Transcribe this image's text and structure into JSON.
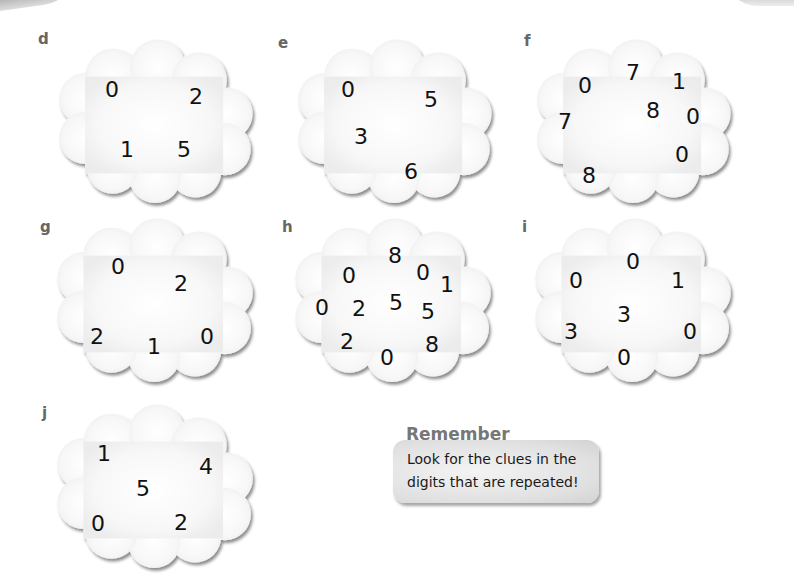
{
  "colors": {
    "cloud_fill": "#fafafa",
    "cloud_shadow": "#9a9a9a",
    "label": "#666666",
    "digit": "#111111",
    "remember_title": "#777777"
  },
  "puzzles": [
    {
      "label": "d",
      "digits": [
        "0",
        "2",
        "1",
        "5"
      ]
    },
    {
      "label": "e",
      "digits": [
        "0",
        "5",
        "3",
        "6"
      ]
    },
    {
      "label": "f",
      "digits": [
        "7",
        "0",
        "1",
        "8",
        "0",
        "7",
        "0",
        "8"
      ]
    },
    {
      "label": "g",
      "digits": [
        "0",
        "2",
        "2",
        "1",
        "0"
      ]
    },
    {
      "label": "h",
      "digits": [
        "8",
        "0",
        "0",
        "1",
        "0",
        "2",
        "5",
        "5",
        "2",
        "0",
        "8"
      ]
    },
    {
      "label": "i",
      "digits": [
        "0",
        "0",
        "1",
        "3",
        "3",
        "0",
        "0"
      ]
    },
    {
      "label": "j",
      "digits": [
        "1",
        "4",
        "5",
        "0",
        "2"
      ]
    }
  ],
  "remember": {
    "title": "Remember",
    "text": "Look for the clues in the digits that are repeated!"
  }
}
